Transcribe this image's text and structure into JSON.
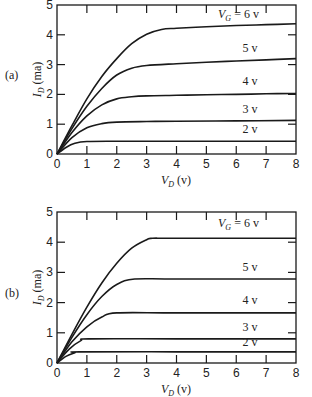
{
  "chart_data": [
    {
      "type": "line",
      "panel_label": "(a)",
      "title": "",
      "xlabel": "V_D (v)",
      "ylabel": "I_D (ma)",
      "xlim": [
        0,
        8
      ],
      "ylim": [
        0,
        5
      ],
      "x_ticks": [
        "0",
        "1",
        "2",
        "3",
        "4",
        "5",
        "6",
        "7",
        "8"
      ],
      "y_ticks": [
        "0",
        "1",
        "2",
        "3",
        "4",
        "5"
      ],
      "grid": false,
      "series": [
        {
          "name": "V_G = 6 v",
          "label": "V_G = 6 v",
          "points": [
            [
              0,
              0
            ],
            [
              0.5,
              0.95
            ],
            [
              1,
              1.85
            ],
            [
              1.5,
              2.6
            ],
            [
              2,
              3.2
            ],
            [
              2.5,
              3.7
            ],
            [
              3,
              4.02
            ],
            [
              3.5,
              4.18
            ],
            [
              4,
              4.22
            ],
            [
              5,
              4.27
            ],
            [
              6,
              4.31
            ],
            [
              7,
              4.34
            ],
            [
              8,
              4.37
            ]
          ]
        },
        {
          "name": "5 v",
          "label": "5 v",
          "points": [
            [
              0,
              0
            ],
            [
              0.5,
              0.85
            ],
            [
              1,
              1.6
            ],
            [
              1.5,
              2.2
            ],
            [
              2,
              2.65
            ],
            [
              2.5,
              2.88
            ],
            [
              3,
              2.97
            ],
            [
              4,
              3.03
            ],
            [
              5,
              3.08
            ],
            [
              6,
              3.12
            ],
            [
              7,
              3.16
            ],
            [
              8,
              3.2
            ]
          ]
        },
        {
          "name": "4 v",
          "label": "4 v",
          "points": [
            [
              0,
              0
            ],
            [
              0.5,
              0.72
            ],
            [
              1,
              1.28
            ],
            [
              1.5,
              1.65
            ],
            [
              2,
              1.85
            ],
            [
              2.5,
              1.92
            ],
            [
              3,
              1.95
            ],
            [
              4,
              1.97
            ],
            [
              5,
              1.99
            ],
            [
              6,
              2.0
            ],
            [
              7,
              2.02
            ],
            [
              8,
              2.03
            ]
          ]
        },
        {
          "name": "3 v",
          "label": "3 v",
          "points": [
            [
              0,
              0
            ],
            [
              0.5,
              0.55
            ],
            [
              1,
              0.88
            ],
            [
              1.5,
              1.02
            ],
            [
              2,
              1.07
            ],
            [
              3,
              1.09
            ],
            [
              4,
              1.1
            ],
            [
              6,
              1.11
            ],
            [
              8,
              1.13
            ]
          ]
        },
        {
          "name": "2 v",
          "label": "2 v",
          "points": [
            [
              0,
              0
            ],
            [
              0.3,
              0.22
            ],
            [
              0.6,
              0.36
            ],
            [
              1,
              0.42
            ],
            [
              2,
              0.43
            ],
            [
              4,
              0.43
            ],
            [
              8,
              0.43
            ]
          ]
        }
      ]
    },
    {
      "type": "line",
      "panel_label": "(b)",
      "title": "",
      "xlabel": "V_D (v)",
      "ylabel": "I_D (ma)",
      "xlim": [
        0,
        8
      ],
      "ylim": [
        0,
        5
      ],
      "x_ticks": [
        "0",
        "1",
        "2",
        "3",
        "4",
        "5",
        "6",
        "7",
        "8"
      ],
      "y_ticks": [
        "0",
        "1",
        "2",
        "3",
        "4",
        "5"
      ],
      "grid": false,
      "series": [
        {
          "name": "V_G = 6 v",
          "label": "V_G = 6 v",
          "points": [
            [
              0,
              0
            ],
            [
              0.5,
              0.95
            ],
            [
              1,
              1.85
            ],
            [
              1.5,
              2.65
            ],
            [
              2,
              3.3
            ],
            [
              2.5,
              3.8
            ],
            [
              3,
              4.08
            ],
            [
              3.2,
              4.13
            ],
            [
              4,
              4.13
            ],
            [
              8,
              4.13
            ]
          ]
        },
        {
          "name": "5 v",
          "label": "5 v",
          "points": [
            [
              0,
              0
            ],
            [
              0.5,
              0.85
            ],
            [
              1,
              1.6
            ],
            [
              1.5,
              2.2
            ],
            [
              2,
              2.6
            ],
            [
              2.6,
              2.78
            ],
            [
              4,
              2.78
            ],
            [
              8,
              2.78
            ]
          ]
        },
        {
          "name": "4 v",
          "label": "4 v",
          "points": [
            [
              0,
              0
            ],
            [
              0.5,
              0.7
            ],
            [
              1,
              1.2
            ],
            [
              1.5,
              1.52
            ],
            [
              2,
              1.66
            ],
            [
              4,
              1.66
            ],
            [
              8,
              1.66
            ]
          ]
        },
        {
          "name": "3 v",
          "label": "3 v",
          "points": [
            [
              0,
              0
            ],
            [
              0.4,
              0.45
            ],
            [
              0.8,
              0.74
            ],
            [
              1.1,
              0.8
            ],
            [
              4,
              0.8
            ],
            [
              8,
              0.8
            ]
          ]
        },
        {
          "name": "2 v",
          "label": "2 v",
          "points": [
            [
              0,
              0
            ],
            [
              0.3,
              0.22
            ],
            [
              0.6,
              0.34
            ],
            [
              0.75,
              0.37
            ],
            [
              4,
              0.37
            ],
            [
              8,
              0.37
            ]
          ]
        }
      ]
    }
  ],
  "panels": [
    {
      "label": "(a)",
      "xlabel_main": "V",
      "xlabel_sub": "D",
      "xlabel_unit": " (v)",
      "ylabel_main": "I",
      "ylabel_sub": "D",
      "ylabel_unit": " (ma)",
      "curve_labels": [
        "= 6 v",
        "5 v",
        "4 v",
        "3 v",
        "2 v"
      ],
      "vg_main": "V",
      "vg_sub": "G"
    },
    {
      "label": "(b)",
      "xlabel_main": "V",
      "xlabel_sub": "D",
      "xlabel_unit": " (v)",
      "ylabel_main": "I",
      "ylabel_sub": "D",
      "ylabel_unit": " (ma)",
      "curve_labels": [
        "= 6 v",
        "5 v",
        "4 v",
        "3 v",
        "2 v"
      ],
      "vg_main": "V",
      "vg_sub": "G"
    }
  ],
  "colors": {
    "line": "#1a1a1a",
    "background": "#ffffff"
  }
}
